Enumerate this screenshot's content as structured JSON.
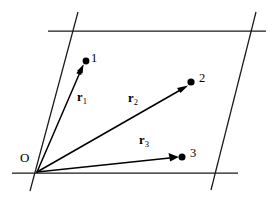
{
  "figure": {
    "background_color": "#ffffff",
    "line_color": "#1a1a1a",
    "vector_color": "#000000",
    "width": 273,
    "height": 209
  },
  "origin": {
    "label": "O",
    "x": 37,
    "y": 172,
    "label_x": 20,
    "label_y": 151
  },
  "cell_lines": [
    {
      "name": "top-horizontal-line",
      "x1": 48,
      "y1": 31,
      "x2": 266,
      "y2": 31
    },
    {
      "name": "bottom-horizontal-line",
      "x1": 12,
      "y1": 173,
      "x2": 238,
      "y2": 173
    },
    {
      "name": "left-slanted-line",
      "x1": 78,
      "y1": 12,
      "x2": 30,
      "y2": 191
    },
    {
      "name": "right-slanted-line",
      "x1": 256,
      "y1": 12,
      "x2": 211,
      "y2": 190
    }
  ],
  "points": [
    {
      "id": "1",
      "label": "1",
      "x": 86,
      "y": 61,
      "radius": 3.4,
      "label_x": 91,
      "label_y": 52
    },
    {
      "id": "2",
      "label": "2",
      "x": 191,
      "y": 82,
      "radius": 3.6,
      "label_x": 199,
      "label_y": 72
    },
    {
      "id": "3",
      "label": "3",
      "x": 182,
      "y": 157,
      "radius": 3.5,
      "label_x": 190,
      "label_y": 147
    }
  ],
  "vectors": [
    {
      "name": "r1",
      "label": "r",
      "subscript": "1",
      "from_x": 37,
      "from_y": 172,
      "to_x": 83,
      "to_y": 66,
      "label_x": 77,
      "label_y": 91
    },
    {
      "name": "r2",
      "label": "r",
      "subscript": "2",
      "from_x": 37,
      "from_y": 172,
      "to_x": 187,
      "to_y": 86,
      "label_x": 128,
      "label_y": 92
    },
    {
      "name": "r3",
      "label": "r",
      "subscript": "3",
      "from_x": 37,
      "from_y": 172,
      "to_x": 178,
      "to_y": 157,
      "label_x": 139,
      "label_y": 134
    }
  ]
}
